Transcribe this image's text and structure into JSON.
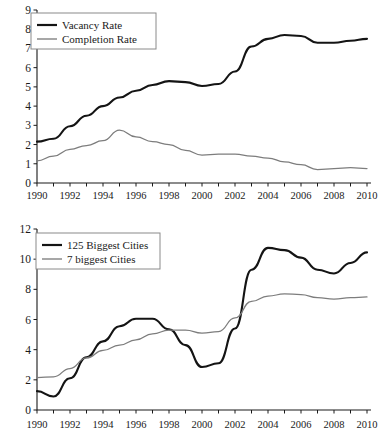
{
  "chart_data": [
    {
      "id": "top",
      "type": "line",
      "title": "",
      "xlabel": "",
      "ylabel": "",
      "xlim": [
        1990,
        2010
      ],
      "ylim": [
        0,
        9
      ],
      "ytick_step": 1,
      "yticks": [
        "0",
        "1",
        "2",
        "3",
        "4",
        "5",
        "6",
        "7",
        "8",
        "9"
      ],
      "xticks": [
        "1990",
        "1992",
        "1994",
        "1996",
        "1998",
        "2000",
        "2002",
        "2004",
        "2006",
        "2008",
        "2010"
      ],
      "xticks_all": [
        1990,
        1991,
        1992,
        1993,
        1994,
        1995,
        1996,
        1997,
        1998,
        1999,
        2000,
        2001,
        2002,
        2003,
        2004,
        2005,
        2006,
        2007,
        2008,
        2009,
        2010
      ],
      "grid": false,
      "legend_position": "upper-left",
      "x": [
        1990,
        1991,
        1992,
        1993,
        1994,
        1995,
        1996,
        1997,
        1998,
        1999,
        2000,
        2001,
        2002,
        2003,
        2004,
        2005,
        2006,
        2007,
        2008,
        2009,
        2010
      ],
      "series": [
        {
          "name": "Vacancy Rate",
          "style": "bold-black",
          "color": "#141414",
          "values": [
            2.15,
            2.3,
            2.95,
            3.5,
            4.0,
            4.45,
            4.8,
            5.1,
            5.3,
            5.25,
            5.05,
            5.15,
            5.8,
            7.1,
            7.5,
            7.7,
            7.65,
            7.3,
            7.3,
            7.4,
            7.5
          ]
        },
        {
          "name": "Completion Rate",
          "style": "thin-gray",
          "color": "#7d7d7d",
          "values": [
            1.15,
            1.4,
            1.75,
            1.95,
            2.2,
            2.75,
            2.4,
            2.15,
            2.0,
            1.7,
            1.45,
            1.5,
            1.5,
            1.4,
            1.3,
            1.1,
            0.95,
            0.7,
            0.75,
            0.8,
            0.75
          ]
        }
      ]
    },
    {
      "id": "bottom",
      "type": "line",
      "title": "",
      "xlabel": "",
      "ylabel": "",
      "xlim": [
        1990,
        2010
      ],
      "ylim": [
        0,
        12
      ],
      "ytick_step": 2,
      "yticks": [
        "0",
        "2",
        "4",
        "6",
        "8",
        "10",
        "12"
      ],
      "xticks": [
        "1990",
        "1992",
        "1994",
        "1996",
        "1998",
        "2000",
        "2002",
        "2004",
        "2006",
        "2008",
        "2010"
      ],
      "xticks_all": [
        1990,
        1991,
        1992,
        1993,
        1994,
        1995,
        1996,
        1997,
        1998,
        1999,
        2000,
        2001,
        2002,
        2003,
        2004,
        2005,
        2006,
        2007,
        2008,
        2009,
        2010
      ],
      "grid": false,
      "legend_position": "upper-left",
      "x": [
        1990,
        1991,
        1992,
        1993,
        1994,
        1995,
        1996,
        1997,
        1998,
        1999,
        2000,
        2001,
        2002,
        2003,
        2004,
        2005,
        2006,
        2007,
        2008,
        2009,
        2010
      ],
      "series": [
        {
          "name": "125 Biggest Cities",
          "style": "bold-black",
          "color": "#141414",
          "values": [
            1.25,
            0.9,
            2.1,
            3.5,
            4.55,
            5.55,
            6.05,
            6.05,
            5.35,
            4.3,
            2.85,
            3.1,
            5.4,
            9.3,
            10.75,
            10.6,
            10.1,
            9.3,
            9.05,
            9.75,
            10.45
          ]
        },
        {
          "name": "7 biggest Cities",
          "style": "thin-gray",
          "color": "#7d7d7d",
          "values": [
            2.15,
            2.2,
            2.75,
            3.45,
            3.95,
            4.3,
            4.65,
            5.05,
            5.3,
            5.3,
            5.1,
            5.2,
            6.1,
            7.2,
            7.55,
            7.7,
            7.65,
            7.45,
            7.35,
            7.45,
            7.5
          ]
        }
      ]
    }
  ]
}
